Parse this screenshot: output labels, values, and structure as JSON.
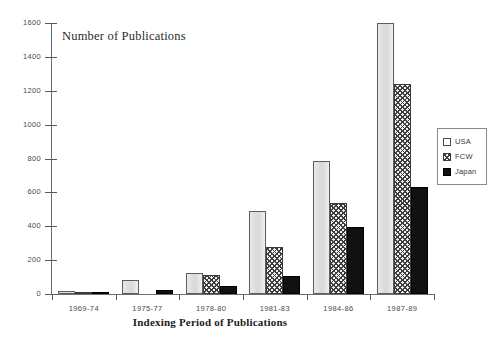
{
  "chart_data": {
    "type": "bar",
    "title": "",
    "xlabel": "Indexing Period of Publications",
    "ylabel": "Number of Publications",
    "categories": [
      "1969-74",
      "1975-77",
      "1978-80",
      "1981-83",
      "1984-86",
      "1987-89"
    ],
    "series": [
      {
        "name": "USA",
        "values": [
          20,
          85,
          125,
          490,
          785,
          1600
        ]
      },
      {
        "name": "FCW",
        "values": [
          5,
          0,
          110,
          275,
          540,
          1240
        ]
      },
      {
        "name": "Japan",
        "values": [
          5,
          25,
          50,
          105,
          395,
          630
        ]
      }
    ],
    "ylim": [
      0,
      1600
    ],
    "yticks": [
      0,
      200,
      400,
      600,
      800,
      1000,
      1200,
      1400,
      1600
    ],
    "ytick_labels": [
      "0",
      "200",
      "400",
      "600",
      "800",
      "1000",
      "1200",
      "1400",
      "1600"
    ],
    "grid": false,
    "legend_position": "right",
    "colors": {
      "usa": "#e2e2e2",
      "fcw": "#f2f2f2",
      "japan": "#111111",
      "axis": "#6f6f6f",
      "text": "#4a4a4a"
    }
  },
  "legend": {
    "items": [
      {
        "label": "USA",
        "swatch": "series-usa"
      },
      {
        "label": "FCW",
        "swatch": "series-fcw"
      },
      {
        "label": "Japan",
        "swatch": "series-japan"
      }
    ]
  }
}
